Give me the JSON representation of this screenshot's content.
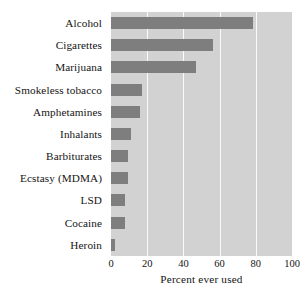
{
  "chart_data": {
    "type": "bar",
    "orientation": "horizontal",
    "title": "",
    "subtitle": "",
    "xlabel": "Percent ever used",
    "ylabel": "",
    "xlim": [
      0,
      100
    ],
    "xticks": [
      0,
      20,
      40,
      60,
      80,
      100
    ],
    "xtick_labels": [
      "0",
      "20",
      "40",
      "60",
      "80",
      "100"
    ],
    "grid": "vertical",
    "legend": "none",
    "categories": [
      "Alcohol",
      "Cigarettes",
      "Marijuana",
      "Smokeless tobacco",
      "Amphetamines",
      "Inhalants",
      "Barbiturates",
      "Ecstasy (MDMA)",
      "LSD",
      "Cocaine",
      "Heroin"
    ],
    "values": [
      78.5,
      56.5,
      47,
      17,
      16,
      11,
      9.5,
      9.5,
      7.5,
      7.5,
      2
    ],
    "colors": {
      "bar": "#7e7e7e",
      "plot_background": "#d2d2d2",
      "gridline": "#fbfbfb",
      "figure_background": "#ffffff",
      "text": "#141414"
    }
  }
}
